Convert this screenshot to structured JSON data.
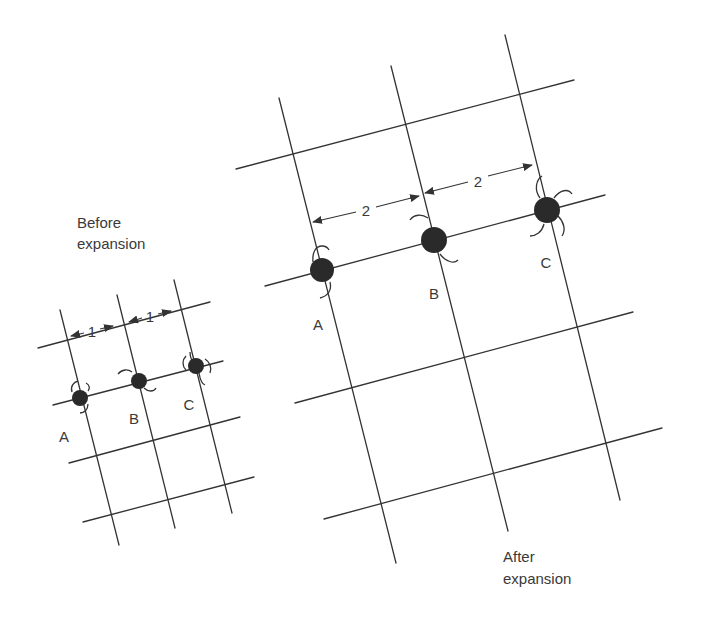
{
  "before": {
    "caption_line1": "Before",
    "caption_line2": "expansion",
    "spacing_label_1": "1",
    "spacing_label_2": "1",
    "atoms": [
      {
        "label": "A"
      },
      {
        "label": "B"
      },
      {
        "label": "C"
      }
    ]
  },
  "after": {
    "caption_line1": "After",
    "caption_line2": "expansion",
    "spacing_label_1": "2",
    "spacing_label_2": "2",
    "atoms": [
      {
        "label": "A"
      },
      {
        "label": "B"
      },
      {
        "label": "C"
      }
    ]
  },
  "colors": {
    "line": "#333333",
    "atom": "#2a2a2a",
    "text": "#3a3a3a",
    "background": "#ffffff"
  }
}
